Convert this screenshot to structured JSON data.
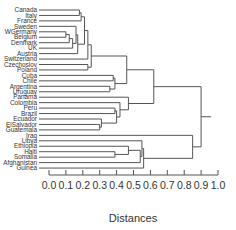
{
  "chart_data": {
    "type": "dendrogram",
    "title": "",
    "xlabel": "Distances",
    "ylabel": "",
    "xlim": [
      0.0,
      1.0
    ],
    "x_ticks": [
      0.0,
      0.1,
      0.2,
      0.3,
      0.4,
      0.5,
      0.6,
      0.7,
      0.8,
      0.9,
      1.0
    ],
    "x_tick_labels": [
      "0.0",
      "0.1",
      "0.2",
      "0.3",
      "0.4",
      "0.5",
      "0.6",
      "0.7",
      "0.8",
      "0.9",
      "1.0"
    ],
    "grid": false,
    "legend": null,
    "leaves": [
      "Canada",
      "Italy",
      "France",
      "Sweden",
      "WGermany",
      "Belgium",
      "Denmark",
      "UK",
      "Austria",
      "Switzerland",
      "Czechoslov",
      "Poland",
      "Cuba",
      "Chile",
      "Argentina",
      "Uruguay",
      "Panama",
      "Colombia",
      "Peru",
      "Brazil",
      "Ecuador",
      "ElSalvador",
      "Guatemala",
      "Iraq",
      "Libya",
      "Ethiopia",
      "Haiti",
      "Somalia",
      "Afghanistan",
      "Guinea"
    ],
    "merges": [
      {
        "members": [
          "WGermany",
          "Belgium"
        ],
        "distance": 0.1
      },
      {
        "members": [
          "WGermany+Belgium",
          "Denmark"
        ],
        "distance": 0.12
      },
      {
        "members": [
          "(WGermany,Belgium,Denmark)",
          "UK"
        ],
        "distance": 0.14
      },
      {
        "members": [
          "Sweden",
          "(WGermany,Belgium,Denmark,UK)"
        ],
        "distance": 0.16
      },
      {
        "members": [
          "(Sweden..UK)",
          "Austria"
        ],
        "distance": 0.17
      },
      {
        "members": [
          "Canada",
          "Italy"
        ],
        "distance": 0.18
      },
      {
        "members": [
          "(Canada,Italy)",
          "France"
        ],
        "distance": 0.19
      },
      {
        "members": [
          "(Canada,Italy,France)",
          "(Sweden..Austria)"
        ],
        "distance": 0.21
      },
      {
        "members": [
          "(Canada..Austria)",
          "Switzerland"
        ],
        "distance": 0.23
      },
      {
        "members": [
          "Czechoslov",
          "Poland"
        ],
        "distance": 0.23
      },
      {
        "members": [
          "(Canada..Switzerland)",
          "(Czechoslov,Poland)"
        ],
        "distance": 0.25
      },
      {
        "members": [
          "Argentina",
          "Uruguay"
        ],
        "distance": 0.36
      },
      {
        "members": [
          "Cuba",
          "Chile"
        ],
        "distance": 0.38
      },
      {
        "members": [
          "(Cuba,Chile)",
          "(Argentina,Uruguay)"
        ],
        "distance": 0.39
      },
      {
        "members": [
          "(Canada..Poland)",
          "(Cuba..Uruguay)"
        ],
        "distance": 0.46
      },
      {
        "members": [
          "ElSalvador",
          "Guatemala"
        ],
        "distance": 0.3
      },
      {
        "members": [
          "Ecuador",
          "(ElSalvador,Guatemala)"
        ],
        "distance": 0.31
      },
      {
        "members": [
          "Peru",
          "Brazil"
        ],
        "distance": 0.39
      },
      {
        "members": [
          "(Peru,Brazil)",
          "(Ecuador,ElSalvador,Guatemala)"
        ],
        "distance": 0.4
      },
      {
        "members": [
          "Colombia",
          "(Peru..Guatemala)"
        ],
        "distance": 0.42
      },
      {
        "members": [
          "Panama",
          "(Colombia..Guatemala)"
        ],
        "distance": 0.47
      },
      {
        "members": [
          "(Canada..Uruguay)",
          "(Panama..Guatemala)"
        ],
        "distance": 0.62
      },
      {
        "members": [
          "Haiti",
          "Somalia"
        ],
        "distance": 0.39
      },
      {
        "members": [
          "Ethiopia",
          "(Haiti,Somalia)"
        ],
        "distance": 0.47
      },
      {
        "members": [
          "(Ethiopia,Haiti,Somalia)",
          "Afghanistan"
        ],
        "distance": 0.54
      },
      {
        "members": [
          "Libya",
          "(Ethiopia..Afghanistan)"
        ],
        "distance": 0.55
      },
      {
        "members": [
          "(Libya..Afghanistan)",
          "Guinea"
        ],
        "distance": 0.56
      },
      {
        "members": [
          "Iraq",
          "(Libya..Guinea)"
        ],
        "distance": 0.85
      },
      {
        "members": [
          "(Canada..Guatemala)",
          "(Iraq..Guinea)"
        ],
        "distance": 0.9
      }
    ],
    "root_distance": 0.9
  }
}
